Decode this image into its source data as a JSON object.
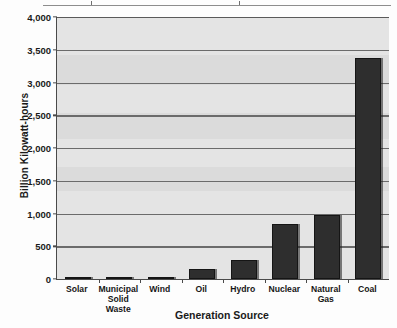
{
  "chart_data": {
    "type": "bar",
    "title": "",
    "xlabel": "Generation Source",
    "ylabel": "Billion Kilowatt-hours",
    "categories": [
      "Solar",
      "Municipal Solid Waste",
      "Wind",
      "Oil",
      "Hydro",
      "Nuclear",
      "Natural Gas",
      "Coal"
    ],
    "values": [
      5,
      25,
      35,
      150,
      290,
      840,
      980,
      3370
    ],
    "ylim": [
      0,
      4000
    ],
    "ytick_values": [
      0,
      500,
      1000,
      1500,
      2000,
      2500,
      3000,
      3500,
      4000
    ],
    "ytick_labels": [
      "0",
      "500",
      "1,000",
      "1,500",
      "2,000",
      "2,500",
      "3,000",
      "3,500",
      "4,000"
    ],
    "grid": true,
    "legend": false,
    "bar_color": "#2e2e2e",
    "plot_background": "#e4e4e4"
  },
  "axis": {
    "y_title": "Billion Kilowatt-hours",
    "x_title": "Generation Source"
  },
  "category_labels": [
    {
      "line1": "Solar",
      "line2": ""
    },
    {
      "line1": "Municipal",
      "line2": "Solid Waste"
    },
    {
      "line1": "Wind",
      "line2": ""
    },
    {
      "line1": "Oil",
      "line2": ""
    },
    {
      "line1": "Hydro",
      "line2": ""
    },
    {
      "line1": "Nuclear",
      "line2": ""
    },
    {
      "line1": "Natural Gas",
      "line2": ""
    },
    {
      "line1": "Coal",
      "line2": ""
    }
  ]
}
